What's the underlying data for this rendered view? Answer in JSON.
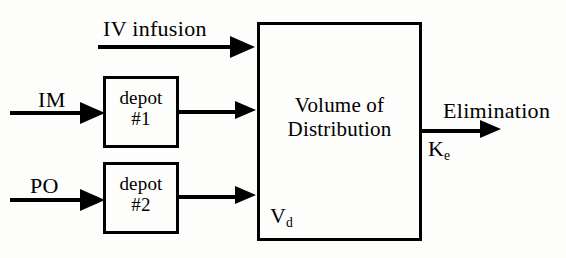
{
  "diagram": {
    "type": "block-flow-diagram",
    "background_color": "#fdfdfc",
    "stroke_color": "#000000"
  },
  "compartments": {
    "central": {
      "line1": "Volume of",
      "line2": "Distribution",
      "symbol_base": "V",
      "symbol_sub": "d"
    },
    "depot1": {
      "line1": "depot",
      "line2": "#1"
    },
    "depot2": {
      "line1": "depot",
      "line2": "#2"
    }
  },
  "routes": {
    "iv": {
      "label": "IV infusion"
    },
    "im": {
      "label": "IM"
    },
    "po": {
      "label": "PO"
    }
  },
  "elimination": {
    "label": "Elimination",
    "rate_constant_base": "K",
    "rate_constant_sub": "e"
  }
}
